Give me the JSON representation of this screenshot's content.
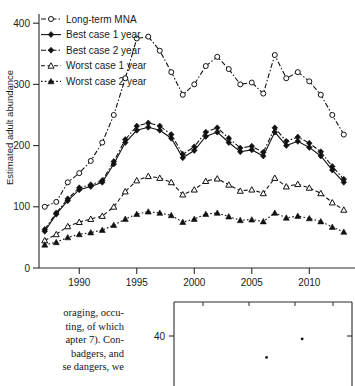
{
  "chart_data": {
    "type": "line",
    "title": "",
    "xlabel": "",
    "ylabel": "Estimated adult abundance",
    "xlim": [
      1986.5,
      2013.8
    ],
    "ylim": [
      0,
      415
    ],
    "xticks": [
      1990,
      1995,
      2000,
      2005,
      2010
    ],
    "yticks": [
      0,
      100,
      200,
      300,
      400
    ],
    "grid": false,
    "legend_position": "top-left",
    "x": [
      1987,
      1988,
      1989,
      1990,
      1991,
      1992,
      1993,
      1994,
      1995,
      1996,
      1997,
      1998,
      1999,
      2000,
      2001,
      2002,
      2003,
      2004,
      2005,
      2006,
      2007,
      2008,
      2009,
      2010,
      2011,
      2012,
      2013
    ],
    "series": [
      {
        "name": "Long-term MNA",
        "marker": "circle-open",
        "line": "dash-dot",
        "values": [
          100,
          108,
          140,
          155,
          175,
          205,
          250,
          310,
          375,
          378,
          355,
          320,
          283,
          300,
          330,
          345,
          325,
          300,
          303,
          285,
          348,
          310,
          320,
          305,
          283,
          250,
          218
        ]
      },
      {
        "name": "Best case 1 year",
        "marker": "diamond-filled",
        "line": "solid",
        "values": [
          60,
          88,
          110,
          128,
          133,
          140,
          170,
          205,
          225,
          230,
          225,
          212,
          180,
          192,
          215,
          222,
          205,
          190,
          193,
          183,
          222,
          200,
          207,
          197,
          183,
          160,
          140
        ]
      },
      {
        "name": "Best case 2 year",
        "marker": "diamond-filled",
        "line": "dash-dot",
        "values": [
          63,
          90,
          113,
          131,
          136,
          143,
          174,
          210,
          232,
          237,
          232,
          218,
          186,
          198,
          222,
          229,
          212,
          196,
          199,
          189,
          229,
          207,
          214,
          204,
          190,
          166,
          145
        ]
      },
      {
        "name": "Worst case 1 year",
        "marker": "triangle-open",
        "line": "dashed",
        "values": [
          45,
          55,
          68,
          75,
          80,
          85,
          100,
          125,
          143,
          150,
          147,
          140,
          120,
          128,
          142,
          146,
          136,
          126,
          128,
          122,
          147,
          133,
          137,
          131,
          122,
          107,
          95
        ]
      },
      {
        "name": "Worst case 2 year",
        "marker": "triangle-filled",
        "line": "dotted",
        "values": [
          38,
          42,
          50,
          55,
          58,
          62,
          70,
          80,
          88,
          92,
          90,
          86,
          75,
          80,
          88,
          90,
          84,
          78,
          79,
          76,
          90,
          82,
          85,
          81,
          76,
          67,
          59
        ]
      }
    ]
  },
  "inset_chart": {
    "type": "scatter",
    "yticks": [
      40
    ],
    "points": [
      [
        0.52,
        38.5
      ],
      [
        0.72,
        44.0
      ]
    ]
  },
  "body_text": {
    "lines": [
      "oraging, occu-",
      "ting, of which",
      "apter 7). Con-",
      "badgers, and",
      "se dangers, we"
    ]
  }
}
